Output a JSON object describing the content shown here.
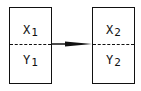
{
  "diagram": {
    "type": "flow",
    "nodes": [
      {
        "id": "node1",
        "top": {
          "var": "X",
          "sub": "1"
        },
        "bottom": {
          "var": "Y",
          "sub": "1"
        }
      },
      {
        "id": "node2",
        "top": {
          "var": "X",
          "sub": "2"
        },
        "bottom": {
          "var": "Y",
          "sub": "2"
        }
      }
    ],
    "edges": [
      {
        "from": "node1",
        "to": "node2",
        "style": "solid-arrow"
      }
    ],
    "colors": {
      "stroke": "#111111",
      "background": "#ffffff"
    }
  }
}
